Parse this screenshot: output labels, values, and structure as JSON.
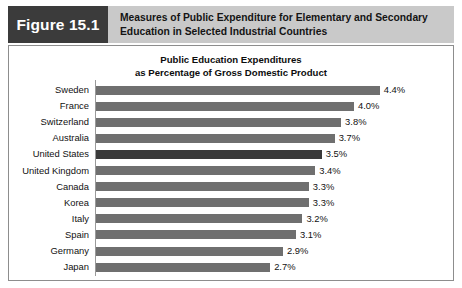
{
  "header": {
    "figure_tag": "Figure 15.1",
    "title_line1": "Measures of Public Expenditure for Elementary and Secondary",
    "title_line2": "Education in Selected Industrial Countries",
    "tag_bg": "#3b3b3b",
    "band_bg": "#c9c9c9"
  },
  "chart_data": {
    "type": "bar",
    "orientation": "horizontal",
    "title": "Public Education Expenditures as Percentage of Gross Domestic Product",
    "title_line1": "Public Education Expenditures",
    "title_line2": "as Percentage of Gross Domestic Product",
    "xlabel": "",
    "ylabel": "",
    "grid": false,
    "legend": false,
    "xlim": [
      0,
      4.6
    ],
    "value_suffix": "%",
    "bar_color": "#6f6f6f",
    "highlight_color": "#3a3a3a",
    "highlight_category": "United States",
    "categories": [
      "Sweden",
      "France",
      "Switzerland",
      "Australia",
      "United States",
      "United Kingdom",
      "Canada",
      "Korea",
      "Italy",
      "Spain",
      "Germany",
      "Japan"
    ],
    "values": [
      4.4,
      4.0,
      3.8,
      3.7,
      3.5,
      3.4,
      3.3,
      3.3,
      3.2,
      3.1,
      2.9,
      2.7
    ],
    "value_labels": [
      "4.4%",
      "4.0%",
      "3.8%",
      "3.7%",
      "3.5%",
      "3.4%",
      "3.3%",
      "3.3%",
      "3.2%",
      "3.1%",
      "2.9%",
      "2.7%"
    ],
    "rows": [
      {
        "label": "Sweden",
        "value": 4.4,
        "value_label": "4.4%",
        "highlight": false
      },
      {
        "label": "France",
        "value": 4.0,
        "value_label": "4.0%",
        "highlight": false
      },
      {
        "label": "Switzerland",
        "value": 3.8,
        "value_label": "3.8%",
        "highlight": false
      },
      {
        "label": "Australia",
        "value": 3.7,
        "value_label": "3.7%",
        "highlight": false
      },
      {
        "label": "United States",
        "value": 3.5,
        "value_label": "3.5%",
        "highlight": true
      },
      {
        "label": "United Kingdom",
        "value": 3.4,
        "value_label": "3.4%",
        "highlight": false
      },
      {
        "label": "Canada",
        "value": 3.3,
        "value_label": "3.3%",
        "highlight": false
      },
      {
        "label": "Korea",
        "value": 3.3,
        "value_label": "3.3%",
        "highlight": false
      },
      {
        "label": "Italy",
        "value": 3.2,
        "value_label": "3.2%",
        "highlight": false
      },
      {
        "label": "Spain",
        "value": 3.1,
        "value_label": "3.1%",
        "highlight": false
      },
      {
        "label": "Germany",
        "value": 2.9,
        "value_label": "2.9%",
        "highlight": false
      },
      {
        "label": "Japan",
        "value": 2.7,
        "value_label": "2.7%",
        "highlight": false
      }
    ]
  }
}
